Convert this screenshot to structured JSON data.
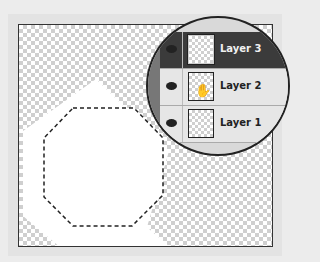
{
  "layers_panel": {
    "layers": [
      {
        "label": "Layer 3",
        "selected": true,
        "visible": true
      },
      {
        "label": "Layer 2",
        "selected": false,
        "visible": true,
        "cursor": "grab-hand-icon"
      },
      {
        "label": "Layer 1",
        "selected": false,
        "visible": true
      }
    ]
  },
  "canvas": {
    "shape": "octagon-selection",
    "background": "transparency-checkerboard",
    "fill_color": "#ffffff",
    "selected_row_color": "#3b3b3b"
  },
  "icons": {
    "hand": "✋"
  }
}
